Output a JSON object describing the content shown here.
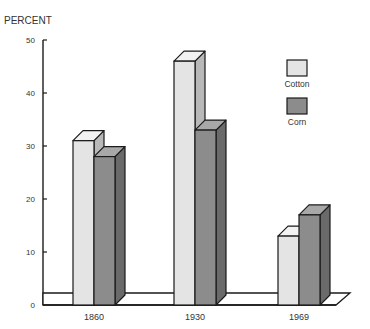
{
  "chart_data": {
    "type": "bar",
    "title": "",
    "ylabel": "PERCENT",
    "xlabel": "",
    "categories": [
      "1860",
      "1930",
      "1969"
    ],
    "series": [
      {
        "name": "Cotton",
        "values": [
          31,
          46,
          13
        ],
        "color": "#e4e4e4"
      },
      {
        "name": "Corn",
        "values": [
          28,
          33,
          17
        ],
        "color": "#8c8c8c"
      }
    ],
    "ylim": [
      0,
      50
    ],
    "yticks": [
      0,
      10,
      20,
      30,
      40,
      50
    ],
    "grid": false,
    "legend_position": "upper-right",
    "style": "3d-bar"
  },
  "colors": {
    "cotton_front": "#e4e4e4",
    "cotton_side": "#b8b8b8",
    "cotton_top": "#f2f2f2",
    "corn_front": "#8c8c8c",
    "corn_side": "#6a6a6a",
    "corn_top": "#a8a8a8",
    "outline": "#1a1a1a"
  }
}
